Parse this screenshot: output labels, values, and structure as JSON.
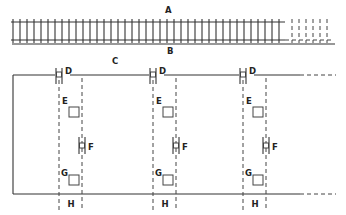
{
  "diagram": {
    "labels": {
      "A": "A",
      "B": "B",
      "C": "C",
      "D": "D",
      "E": "E",
      "F": "F",
      "G": "G",
      "H": "H"
    },
    "track": {
      "top_y": 22,
      "bottom_y": 40,
      "x_start": 13,
      "solid_end": 285,
      "dashed_end": 332,
      "tick_spacing": 7
    },
    "units": [
      {
        "left_x": 59,
        "right_x": 82
      },
      {
        "left_x": 153,
        "right_x": 176
      },
      {
        "left_x": 243,
        "right_x": 266
      }
    ]
  }
}
